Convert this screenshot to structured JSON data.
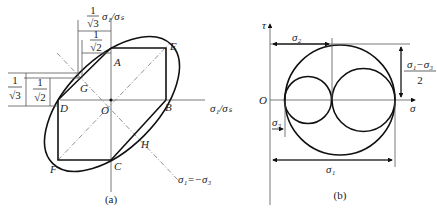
{
  "panel_a": {
    "caption": "(a)",
    "points": {
      "A": "A",
      "B": "B",
      "C": "C",
      "D": "D",
      "E": "E",
      "F": "F",
      "G": "G",
      "H": "H",
      "O": "O"
    },
    "top_dim_1": {
      "num": "1",
      "den": "√3",
      "suffix": "σ₁/σₛ"
    },
    "top_dim_2": {
      "num": "1",
      "den": "√2"
    },
    "left_dim_1": {
      "num": "1",
      "den": "√3"
    },
    "left_dim_2": {
      "num": "1",
      "den": "√2"
    },
    "x_axis_label": "σ₁/σₛ",
    "line_label": "σ₁=−σ₃"
  },
  "panel_b": {
    "caption": "(b)",
    "y_axis_label": "τ",
    "x_axis_label": "σ",
    "origin_label": "O",
    "dim_sigma2": "σ₂",
    "dim_sigma3": "σ₃",
    "dim_sigma1": "σ₁",
    "dim_radius_num": "σ₁−σ₃",
    "dim_radius_den": "2"
  }
}
